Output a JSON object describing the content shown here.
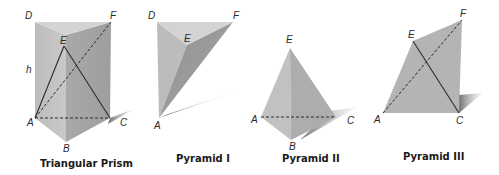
{
  "figures": [
    {
      "id": "triangular-prism",
      "caption": "Triangular Prism",
      "labels": {
        "D": "D",
        "E": "E",
        "F": "F",
        "h": "h",
        "A": "A",
        "B": "B",
        "C": "C"
      }
    },
    {
      "id": "pyramid-1",
      "caption": "Pyramid I",
      "labels": {
        "D": "D",
        "E": "E",
        "F": "F",
        "A": "A"
      }
    },
    {
      "id": "pyramid-2",
      "caption": "Pyramid II",
      "labels": {
        "E": "E",
        "A": "A",
        "B": "B",
        "C": "C"
      }
    },
    {
      "id": "pyramid-3",
      "caption": "Pyramid III",
      "labels": {
        "E": "E",
        "F": "F",
        "A": "A",
        "C": "C"
      }
    }
  ],
  "colors": {
    "face_light": "#c9c9c9",
    "face_mid": "#b3b3b3",
    "face_dark": "#9a9a9a",
    "top_face": "#d6d6d6",
    "edge": "#2b2b2b"
  }
}
